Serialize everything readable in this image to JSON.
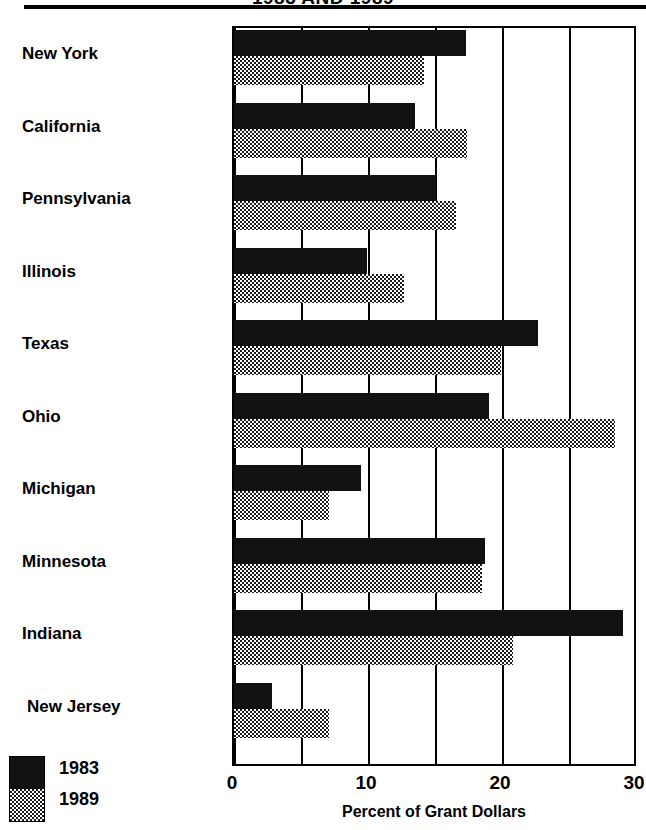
{
  "chart_data": {
    "type": "bar",
    "orientation": "horizontal",
    "title": "1983 AND 1989",
    "xlabel": "Percent of Grant Dollars",
    "ylabel": "",
    "xlim": [
      0,
      30
    ],
    "xticks": [
      0,
      10,
      20,
      30
    ],
    "xtick_labels": [
      "0",
      "10",
      "20",
      "30"
    ],
    "gridlines": [
      0,
      5,
      10,
      15,
      20,
      25,
      30
    ],
    "grid": true,
    "legend_position": "bottom-left",
    "categories": [
      "New York",
      "California",
      "Pennsylvania",
      "Illinois",
      "Texas",
      "Ohio",
      "Michigan",
      "Minnesota",
      "Indiana",
      "New Jersey"
    ],
    "series": [
      {
        "name": "1983",
        "color": "#111111",
        "pattern": "solid",
        "values": [
          17.3,
          13.5,
          15.1,
          9.9,
          22.7,
          19.0,
          9.5,
          18.7,
          29.0,
          2.8
        ]
      },
      {
        "name": "1989",
        "color": "#1a1a1a",
        "pattern": "checkerboard",
        "values": [
          14.2,
          17.4,
          16.6,
          12.7,
          19.9,
          28.4,
          7.1,
          18.5,
          20.8,
          7.1
        ]
      }
    ]
  },
  "legend": {
    "entries": [
      "1983",
      "1989"
    ]
  }
}
